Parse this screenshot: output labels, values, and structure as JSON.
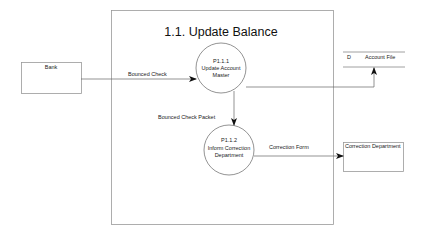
{
  "diagram": {
    "title": "1.1. Update Balance",
    "external_entities": [
      {
        "id": "bank",
        "label": "Bank"
      },
      {
        "id": "correction-department",
        "label": "Correction Department"
      }
    ],
    "processes": [
      {
        "id": "P1.1.1",
        "number": "P1.1.1",
        "name_line1": "Update Account",
        "name_line2": "Master"
      },
      {
        "id": "P1.1.2",
        "number": "P1.1.2",
        "name_line1": "Inform Correction",
        "name_line2": "Department"
      }
    ],
    "data_stores": [
      {
        "id": "D",
        "prefix": "D",
        "label": "Account File"
      }
    ],
    "flows": [
      {
        "from": "Bank",
        "to": "P1.1.1",
        "label": "Bounced Check"
      },
      {
        "from": "P1.1.1",
        "to": "P1.1.2",
        "label": "Bounced Check Packet"
      },
      {
        "from": "P1.1.1",
        "to": "Account File",
        "label": ""
      },
      {
        "from": "P1.1.2",
        "to": "Correction Department",
        "label": "Correction Form"
      }
    ]
  }
}
